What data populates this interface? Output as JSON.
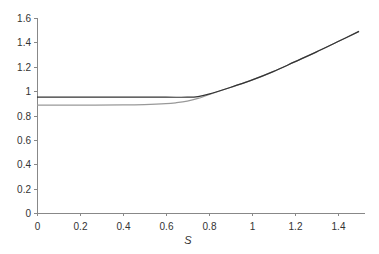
{
  "chart_data": {
    "type": "line",
    "title": "",
    "xlabel": "S",
    "ylabel": "",
    "xlim": [
      0,
      1.5
    ],
    "ylim": [
      0,
      1.6
    ],
    "grid": false,
    "legend": null,
    "x_ticks": [
      "0",
      "0.2",
      "0.4",
      "0.6",
      "0.8",
      "1",
      "1.2",
      "1.4"
    ],
    "y_ticks": [
      "0",
      "0.2",
      "0.4",
      "0.6",
      "0.8",
      "1",
      "1.2",
      "1.4",
      "1.6"
    ],
    "series": [
      {
        "name": "dark",
        "color": "#333333",
        "x": [
          0,
          0.2,
          0.4,
          0.6,
          0.7,
          0.75,
          0.8,
          0.9,
          1.0,
          1.1,
          1.2,
          1.3,
          1.4,
          1.5
        ],
        "y": [
          0.95,
          0.95,
          0.95,
          0.95,
          0.95,
          0.955,
          0.975,
          1.03,
          1.09,
          1.16,
          1.24,
          1.32,
          1.405,
          1.49
        ]
      },
      {
        "name": "gray",
        "color": "#999999",
        "x": [
          0,
          0.2,
          0.4,
          0.5,
          0.6,
          0.65,
          0.7,
          0.75,
          0.8,
          0.9,
          1.0,
          1.1,
          1.2,
          1.3,
          1.4,
          1.5
        ],
        "y": [
          0.885,
          0.885,
          0.887,
          0.89,
          0.897,
          0.905,
          0.918,
          0.94,
          0.97,
          1.03,
          1.09,
          1.16,
          1.24,
          1.32,
          1.405,
          1.49
        ]
      }
    ]
  }
}
